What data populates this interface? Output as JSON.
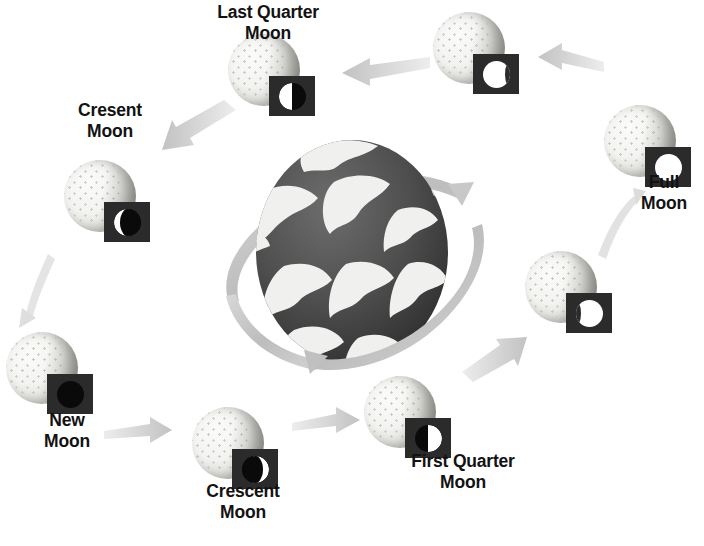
{
  "diagram": {
    "center_body": "earth",
    "background_color": "#ffffff",
    "arrow_color": "#c9c9c9",
    "label_color": "#121212",
    "chip_color": "#2b2b2b"
  },
  "phases": [
    {
      "id": "new-moon",
      "label": "New\nMoon",
      "phase_icon": "new-moon-icon",
      "phase_class": "ph-new",
      "moon_x": 42,
      "moon_y": 368,
      "chip_x": 70,
      "chip_y": 394,
      "label_x": 67,
      "label_y": 410,
      "labeled": true
    },
    {
      "id": "crescent-moon-waxing",
      "label": "Crescent\nMoon",
      "phase_icon": "waxing-crescent-icon",
      "phase_class": "ph-cres-w",
      "moon_x": 228,
      "moon_y": 443,
      "chip_x": 255,
      "chip_y": 469,
      "label_x": 243,
      "label_y": 481,
      "labeled": true
    },
    {
      "id": "first-quarter-moon",
      "label": "First Quarter\nMoon",
      "phase_icon": "first-quarter-icon",
      "phase_class": "ph-first",
      "moon_x": 400,
      "moon_y": 412,
      "chip_x": 428,
      "chip_y": 438,
      "label_x": 463,
      "label_y": 451,
      "labeled": true
    },
    {
      "id": "waxing-gibbous-moon",
      "label": "",
      "phase_icon": "waxing-gibbous-icon",
      "phase_class": "ph-gibb-w",
      "moon_x": 561,
      "moon_y": 287,
      "chip_x": 589,
      "chip_y": 313,
      "label_x": 0,
      "label_y": 0,
      "labeled": false
    },
    {
      "id": "full-moon",
      "label": "Full\nMoon",
      "phase_icon": "full-moon-icon",
      "phase_class": "ph-full",
      "moon_x": 640,
      "moon_y": 141,
      "chip_x": 668,
      "chip_y": 167,
      "label_x": 664,
      "label_y": 172,
      "labeled": true
    },
    {
      "id": "waning-gibbous-moon",
      "label": "",
      "phase_icon": "waning-gibbous-icon",
      "phase_class": "ph-gibb-n",
      "moon_x": 469,
      "moon_y": 48,
      "chip_x": 496,
      "chip_y": 74,
      "label_x": 0,
      "label_y": 0,
      "labeled": false
    },
    {
      "id": "last-quarter-moon",
      "label": "Last Quarter\nMoon",
      "phase_icon": "last-quarter-icon",
      "phase_class": "ph-last",
      "moon_x": 264,
      "moon_y": 70,
      "chip_x": 292,
      "chip_y": 96,
      "label_x": 268,
      "label_y": 2,
      "labeled": true
    },
    {
      "id": "cresent-moon-waning",
      "label": "Cresent\nMoon",
      "phase_icon": "waning-crescent-icon",
      "phase_class": "ph-cres-n",
      "moon_x": 100,
      "moon_y": 196,
      "chip_x": 127,
      "chip_y": 222,
      "label_x": 110,
      "label_y": 100,
      "labeled": true
    }
  ],
  "arrows": [
    {
      "id": "arrow-new-to-crescent",
      "from": "new-moon",
      "to": "crescent-moon-waxing",
      "direction": "right"
    },
    {
      "id": "arrow-crescent-to-first",
      "from": "crescent-moon-waxing",
      "to": "first-quarter-moon",
      "direction": "right"
    },
    {
      "id": "arrow-first-to-gibbous",
      "from": "first-quarter-moon",
      "to": "waxing-gibbous-moon",
      "direction": "up-right"
    },
    {
      "id": "arrow-gibbous-to-full",
      "from": "waxing-gibbous-moon",
      "to": "full-moon",
      "direction": "up"
    },
    {
      "id": "arrow-full-to-gibbous",
      "from": "full-moon",
      "to": "waning-gibbous-moon",
      "direction": "left"
    },
    {
      "id": "arrow-gibbous-to-last",
      "from": "waning-gibbous-moon",
      "to": "last-quarter-moon",
      "direction": "left"
    },
    {
      "id": "arrow-last-to-cresent",
      "from": "last-quarter-moon",
      "to": "cresent-moon-waning",
      "direction": "down-left"
    },
    {
      "id": "arrow-cresent-to-new",
      "from": "cresent-moon-waning",
      "to": "new-moon",
      "direction": "down-left"
    }
  ],
  "earth": {
    "name": "earth",
    "body_color": "#4a4a4a",
    "cloud_color": "#f2f2f2",
    "orbit_color": "#c4c4c4",
    "orbit_arrowheads": 2
  }
}
